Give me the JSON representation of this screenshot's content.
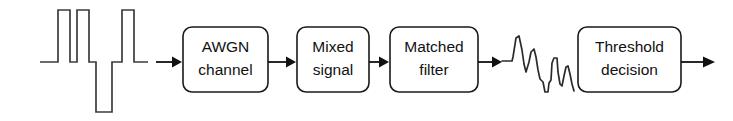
{
  "diagram": {
    "background_color": "#ffffff",
    "stroke_color": "#1a1a1a",
    "text_color": "#111111",
    "waveform_color": "#3c3c3c",
    "blocks": [
      {
        "id": "awgn-channel",
        "line1": "AWGN",
        "line2": "channel"
      },
      {
        "id": "mixed-signal",
        "line1": "Mixed",
        "line2": "signal"
      },
      {
        "id": "matched-filter",
        "line1": "Matched",
        "line2": "filter"
      },
      {
        "id": "threshold-decision",
        "line1": "Threshold",
        "line2": "decision"
      }
    ],
    "signals": [
      {
        "id": "input-digital-waveform",
        "name": "digital-pulse-waveform",
        "description": "bipolar rectangular pulse train"
      },
      {
        "id": "filtered-analog-waveform",
        "name": "noisy-analog-waveform",
        "description": "noisy filtered analog signal"
      }
    ],
    "arrows": [
      {
        "id": "arrow-input-to-awgn"
      },
      {
        "id": "arrow-awgn-to-mixed"
      },
      {
        "id": "arrow-mixed-to-matched"
      },
      {
        "id": "arrow-matched-to-analog"
      },
      {
        "id": "arrow-threshold-output"
      }
    ]
  }
}
